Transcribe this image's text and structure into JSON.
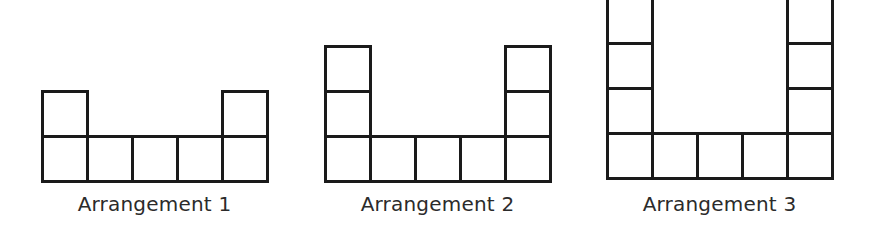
{
  "figure": {
    "background_color": "#ffffff",
    "stroke_color": "#1a1a1a",
    "stroke_width": 3,
    "cell_size": 45,
    "arrangements": [
      {
        "id": "arrangement-1",
        "label": "Arrangement 1",
        "origin_x": 42,
        "base_y": 136,
        "base_row_count": 5,
        "left_stack_height": 1,
        "right_stack_height": 1,
        "total_squares": 7,
        "cells": [
          {
            "col": 0,
            "row": 0
          },
          {
            "col": 1,
            "row": 0
          },
          {
            "col": 2,
            "row": 0
          },
          {
            "col": 3,
            "row": 0
          },
          {
            "col": 4,
            "row": 0
          },
          {
            "col": 0,
            "row": 1
          },
          {
            "col": 4,
            "row": 1
          }
        ]
      },
      {
        "id": "arrangement-2",
        "label": "Arrangement 2",
        "origin_x": 325,
        "base_y": 136,
        "base_row_count": 5,
        "left_stack_height": 2,
        "right_stack_height": 2,
        "total_squares": 9,
        "cells": [
          {
            "col": 0,
            "row": 0
          },
          {
            "col": 1,
            "row": 0
          },
          {
            "col": 2,
            "row": 0
          },
          {
            "col": 3,
            "row": 0
          },
          {
            "col": 4,
            "row": 0
          },
          {
            "col": 0,
            "row": 1
          },
          {
            "col": 4,
            "row": 1
          },
          {
            "col": 0,
            "row": 2
          },
          {
            "col": 4,
            "row": 2
          }
        ]
      },
      {
        "id": "arrangement-3",
        "label": "Arrangement 3",
        "origin_x": 607,
        "base_y": 133,
        "base_row_count": 5,
        "left_stack_height": 3,
        "right_stack_height": 3,
        "total_squares": 11,
        "cells": [
          {
            "col": 0,
            "row": 0
          },
          {
            "col": 1,
            "row": 0
          },
          {
            "col": 2,
            "row": 0
          },
          {
            "col": 3,
            "row": 0
          },
          {
            "col": 4,
            "row": 0
          },
          {
            "col": 0,
            "row": 1
          },
          {
            "col": 4,
            "row": 1
          },
          {
            "col": 0,
            "row": 2
          },
          {
            "col": 4,
            "row": 2
          },
          {
            "col": 0,
            "row": 3
          },
          {
            "col": 4,
            "row": 3
          }
        ]
      }
    ]
  },
  "captions": {
    "c1": "Arrangement 1",
    "c2": "Arrangement 2",
    "c3": "Arrangement 3"
  }
}
